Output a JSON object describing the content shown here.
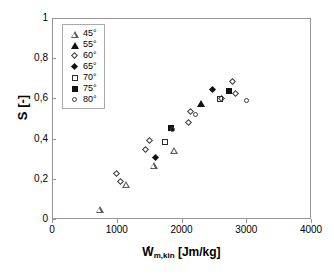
{
  "chart_data": {
    "type": "scatter",
    "title": "",
    "xlabel": "W*_m,kin [Jm/kg]",
    "ylabel": "S [-]",
    "xlim": [
      0,
      4000
    ],
    "ylim": [
      0,
      1
    ],
    "xticks": [
      "0",
      "1000",
      "2000",
      "3000",
      "4000"
    ],
    "xtick_values": [
      0,
      1000,
      2000,
      3000,
      4000
    ],
    "yticks": [
      "0",
      "0,2",
      "0,4",
      "0,6",
      "0,8",
      "1"
    ],
    "ytick_values": [
      0,
      0.2,
      0.4,
      0.6,
      0.8,
      1
    ],
    "grid": false,
    "legend_position": "top-left",
    "decimal_separator": ",",
    "series": [
      {
        "name": "45°",
        "marker": "triangle-open",
        "points": [
          {
            "x": 735,
            "y": 0.05
          },
          {
            "x": 1145,
            "y": 0.175
          },
          {
            "x": 1570,
            "y": 0.27
          },
          {
            "x": 1890,
            "y": 0.345
          }
        ]
      },
      {
        "name": "55°",
        "marker": "triangle-filled",
        "points": [
          {
            "x": 2300,
            "y": 0.578
          }
        ]
      },
      {
        "name": "60°",
        "marker": "diamond-open",
        "points": [
          {
            "x": 1010,
            "y": 0.222
          },
          {
            "x": 1060,
            "y": 0.183
          },
          {
            "x": 1450,
            "y": 0.345
          },
          {
            "x": 1510,
            "y": 0.389
          },
          {
            "x": 2120,
            "y": 0.478
          },
          {
            "x": 2150,
            "y": 0.53
          },
          {
            "x": 2630,
            "y": 0.598
          },
          {
            "x": 2800,
            "y": 0.68
          },
          {
            "x": 2835,
            "y": 0.622
          }
        ]
      },
      {
        "name": "65°",
        "marker": "diamond-filled",
        "points": [
          {
            "x": 1600,
            "y": 0.302
          },
          {
            "x": 2490,
            "y": 0.64
          }
        ]
      },
      {
        "name": "70°",
        "marker": "square-open",
        "points": [
          {
            "x": 1740,
            "y": 0.382
          },
          {
            "x": 2600,
            "y": 0.598
          }
        ]
      },
      {
        "name": "75°",
        "marker": "square-filled",
        "points": [
          {
            "x": 1840,
            "y": 0.452
          },
          {
            "x": 2740,
            "y": 0.635
          }
        ]
      },
      {
        "name": "80°",
        "marker": "circle-open",
        "points": [
          {
            "x": 1875,
            "y": 0.443
          },
          {
            "x": 2220,
            "y": 0.518
          },
          {
            "x": 3010,
            "y": 0.585
          }
        ]
      }
    ]
  },
  "axis": {
    "ylabel_main": "S [-]",
    "xlabel_var": "W",
    "xlabel_sub": "m,kin",
    "xlabel_unit": "[Jm/kg]"
  }
}
